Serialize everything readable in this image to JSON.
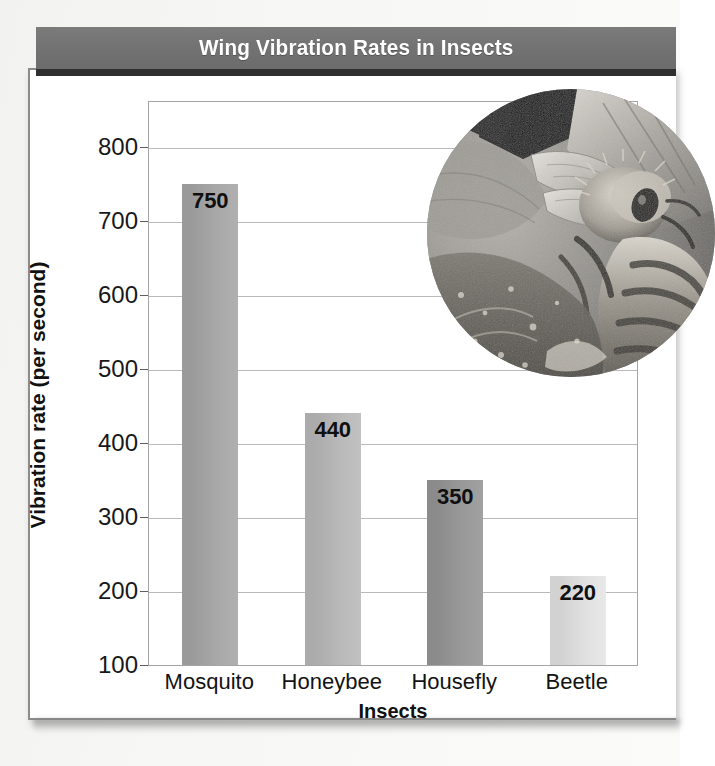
{
  "title": "Wing Vibration Rates in Insects",
  "colors": {
    "banner_bg": "#737373",
    "banner_text": "#ffffff",
    "banner_shadow": "#2f2f2f",
    "panel_border": "#8c8c8c",
    "gridline": "#b9b9b9",
    "axis_text": "#181818",
    "bar_mosquito": "#9a9a9a",
    "bar_honeybee": "#ababab",
    "bar_housefly": "#8b8b8b",
    "bar_beetle": "#d2d2d2"
  },
  "chart_data": {
    "type": "bar",
    "title": "Wing Vibration Rates in Insects",
    "xlabel": "Insects",
    "ylabel": "Vibration rate (per second)",
    "categories": [
      "Mosquito",
      "Honeybee",
      "Housefly",
      "Beetle"
    ],
    "values": [
      750,
      440,
      350,
      220
    ],
    "value_labels": [
      "750",
      "440",
      "350",
      "220"
    ],
    "ylim": [
      100,
      830
    ],
    "yticks": [
      800,
      700,
      600,
      500,
      400,
      300,
      200,
      100
    ],
    "ytick_labels": [
      "800",
      "700",
      "600",
      "500",
      "400",
      "300",
      "200",
      "100"
    ],
    "grid": true,
    "legend": "none",
    "bar_colors": [
      "#9a9a9a",
      "#ababab",
      "#8b8b8b",
      "#d2d2d2"
    ]
  },
  "inset": {
    "caption": "honeybee-on-flower-photo",
    "description": "Circular grayscale close-up photograph of a honeybee on a flower"
  }
}
